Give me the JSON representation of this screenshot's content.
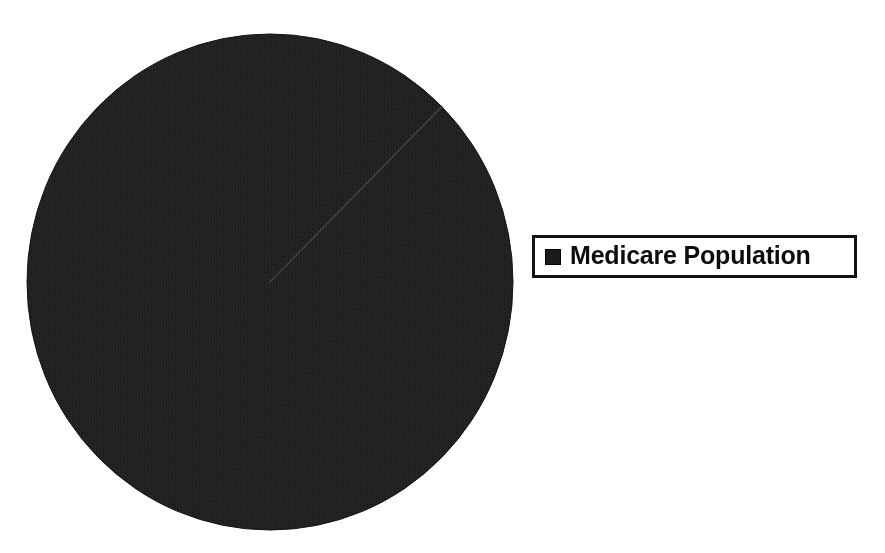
{
  "figure": {
    "background_color": "#ffffff",
    "width": 885,
    "height": 553
  },
  "legend": {
    "position": "right",
    "border_color": "#111111",
    "entries": [
      {
        "label": "Medicare Population",
        "swatch_color": "#1b1b1b"
      }
    ]
  },
  "chart_data": {
    "type": "pie",
    "title": "",
    "subtitle": "",
    "xlabel": "",
    "ylabel": "",
    "grid": false,
    "legend_position": "right",
    "start_angle_deg": 45,
    "categories": [
      "Medicare Population"
    ],
    "values": [
      100
    ],
    "value_unit": "percent",
    "slices": [
      {
        "label": "Medicare Population",
        "value": 100,
        "percent": "100%",
        "color": "#1b1b1b",
        "start_angle_deg": 45,
        "end_angle_deg": 405
      }
    ],
    "annotations": [
      {
        "name": "slice-divider",
        "description": "single radius line at 45 degrees from center to edge"
      }
    ]
  }
}
